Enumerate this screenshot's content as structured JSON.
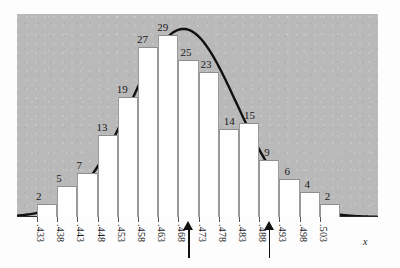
{
  "chart_data": {
    "type": "bar",
    "title": "",
    "subtitle": "",
    "xlabel": "x",
    "ylabel": "",
    "categories": [
      ".433",
      ".438",
      ".443",
      ".448",
      ".453",
      ".458",
      ".463",
      ".468",
      ".473",
      ".478",
      ".483",
      ".488",
      ".493",
      ".498",
      ".503"
    ],
    "bin_edge_labels": [
      ".433",
      ".438",
      ".443",
      ".448",
      ".453",
      ".458",
      ".463",
      ".468",
      ".473",
      ".478",
      ".483",
      ".488",
      ".493",
      ".498",
      ".503"
    ],
    "values": [
      2,
      5,
      7,
      13,
      19,
      27,
      29,
      25,
      23,
      14,
      15,
      9,
      6,
      4,
      2
    ],
    "bar_labels": [
      "2",
      "5",
      "7",
      "13",
      "19",
      "27",
      "29",
      "25",
      "23",
      "14",
      "15",
      "9",
      "6",
      "4",
      "2"
    ],
    "ylim": [
      0,
      31
    ],
    "grid": false,
    "legend": null,
    "overlay": {
      "type": "line",
      "name": "normal-curve",
      "color": "#111111"
    },
    "colors": {
      "plot_background": "#b9b9b9",
      "bar_fill": "#fefefe",
      "bar_border": "#9a9a9a",
      "curve": "#111111",
      "axis": "#2a2a2a",
      "text": "#1a1a1a",
      "arrow": "#111111"
    },
    "annotations": [
      {
        "name": "arrow-marker-1",
        "label": "",
        "between": [
          ".468",
          ".473"
        ]
      },
      {
        "name": "arrow-marker-2",
        "label": "",
        "between": [
          ".488",
          ".493"
        ]
      }
    ]
  }
}
